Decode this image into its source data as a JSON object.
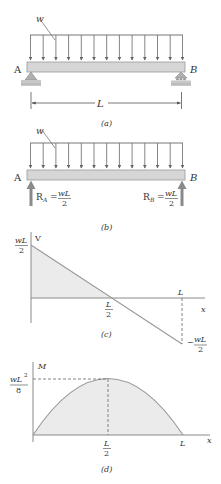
{
  "colors": {
    "line": "#8a8a8a",
    "dark_line": "#555555",
    "beam_fill": "#d6d6d6",
    "shade_fill": "#ebebeb",
    "text": "#333333",
    "support_fill": "#b0b0b0"
  },
  "panel_a": {
    "load_label": "w",
    "left_support_label": "A",
    "right_support_label": "B",
    "span_label": "L",
    "caption": "(a)"
  },
  "panel_b": {
    "load_label": "w",
    "left_support_label": "A",
    "right_support_label": "B",
    "reaction_a": {
      "symbol": "R",
      "subscript": "A",
      "equals": "=",
      "numerator": "wL",
      "denominator": "2"
    },
    "reaction_b": {
      "symbol": "R",
      "subscript": "B",
      "equals": "=",
      "numerator": "wL",
      "denominator": "2"
    },
    "caption": "(b)"
  },
  "panel_c": {
    "y_axis_label": "V",
    "x_axis_label": "x",
    "y_max_numerator": "wL",
    "y_max_denominator": "2",
    "y_min_prefix": "−",
    "y_min_numerator": "wL",
    "y_min_denominator": "2",
    "mid_numerator": "L",
    "mid_denominator": "2",
    "end_label": "L",
    "caption": "(c)"
  },
  "panel_d": {
    "y_axis_label": "M",
    "x_axis_label": "x",
    "y_max_numerator": "wL",
    "y_max_superscript": "2",
    "y_max_denominator": "8",
    "mid_numerator": "L",
    "mid_denominator": "2",
    "end_label": "L",
    "caption": "(d)"
  }
}
